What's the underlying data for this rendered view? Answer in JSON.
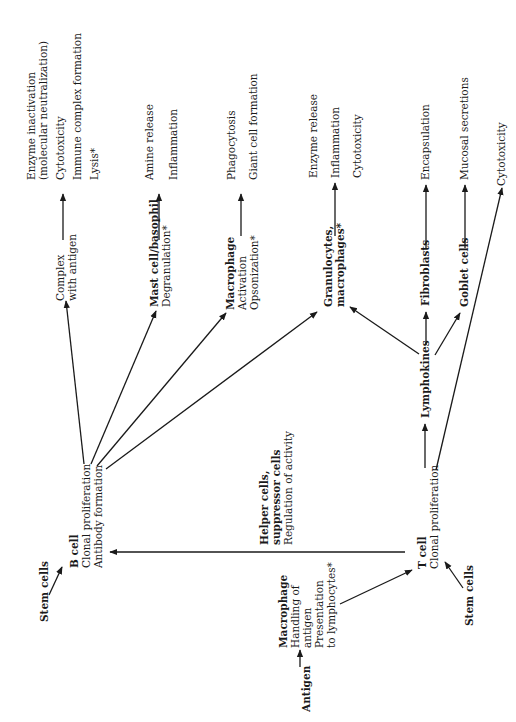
{
  "diagram": {
    "nodes": {
      "stem_cells_b": {
        "lines": [
          "Stem cells"
        ],
        "bold": true
      },
      "b_cell": {
        "lines": [
          "B cell",
          "Clonal proliferation",
          "Antibody formation"
        ],
        "bold_first": true
      },
      "complex": {
        "lines": [
          "Complex",
          "with antigen"
        ]
      },
      "mast_cell": {
        "lines": [
          "Mast cell/basophil",
          "Degranulation*"
        ],
        "bold_first": true
      },
      "macrophage_b": {
        "lines": [
          "Macrophage",
          "Activation",
          "Opsonization*"
        ],
        "bold_first": true
      },
      "granulocytes": {
        "lines": [
          "Granulocytes,",
          "macrophages*"
        ],
        "bold": true
      },
      "outcomes_complex": {
        "lines": [
          "Enzyme inactivation",
          "(molecular neutralization)",
          "Cytotoxicity",
          "Immune complex formation",
          "Lysis*"
        ]
      },
      "outcomes_mast": {
        "lines": [
          "Amine release",
          "Inflammation"
        ]
      },
      "outcomes_macrophage": {
        "lines": [
          "Phagocytosis",
          "Giant cell formation"
        ]
      },
      "outcomes_granulocytes": {
        "lines": [
          "Enzyme release",
          "Inflammation",
          "Cytotoxicity"
        ]
      },
      "lymphokines": {
        "lines": [
          "Lymphokines"
        ],
        "bold": true
      },
      "fibroblasts": {
        "lines": [
          "Fibroblasts"
        ],
        "bold": true
      },
      "goblet_cells": {
        "lines": [
          "Goblet cells"
        ],
        "bold": true
      },
      "encapsulation": {
        "lines": [
          "Encapsulation"
        ]
      },
      "mucosal_secretions": {
        "lines": [
          "Mucosal secretions"
        ]
      },
      "cytotoxicity_t": {
        "lines": [
          "Cytotoxicity"
        ]
      },
      "helper_cells": {
        "lines": [
          "Helper cells,",
          "suppressor cells",
          "Regulation of activity"
        ],
        "bold_first_two": true
      },
      "t_cell": {
        "lines": [
          "T cell",
          "Clonal proliferation"
        ],
        "bold_first": true
      },
      "stem_cells_t": {
        "lines": [
          "Stem cells"
        ],
        "bold": true
      },
      "macrophage_t": {
        "lines": [
          "Macrophage",
          "Handling of",
          "antigen",
          "Presentation",
          "to lymphocytes*"
        ],
        "bold_first": true
      },
      "antigen": {
        "lines": [
          "Antigen"
        ],
        "bold": true
      }
    },
    "edges": [
      {
        "from": "stem_cells_b",
        "to": "b_cell"
      },
      {
        "from": "b_cell",
        "to": "complex"
      },
      {
        "from": "b_cell",
        "to": "mast_cell"
      },
      {
        "from": "b_cell",
        "to": "macrophage_b"
      },
      {
        "from": "b_cell",
        "to": "granulocytes"
      },
      {
        "from": "complex",
        "to": "outcomes_complex"
      },
      {
        "from": "mast_cell",
        "to": "outcomes_mast"
      },
      {
        "from": "macrophage_b",
        "to": "outcomes_macrophage"
      },
      {
        "from": "granulocytes",
        "to": "outcomes_granulocytes"
      },
      {
        "from": "t_cell",
        "to": "b_cell",
        "label": "helper_cells"
      },
      {
        "from": "t_cell",
        "to": "lymphokines"
      },
      {
        "from": "t_cell",
        "to": "cytotoxicity_t"
      },
      {
        "from": "lymphokines",
        "to": "granulocytes"
      },
      {
        "from": "lymphokines",
        "to": "fibroblasts"
      },
      {
        "from": "lymphokines",
        "to": "goblet_cells"
      },
      {
        "from": "fibroblasts",
        "to": "encapsulation"
      },
      {
        "from": "goblet_cells",
        "to": "mucosal_secretions"
      },
      {
        "from": "stem_cells_t",
        "to": "t_cell"
      },
      {
        "from": "antigen",
        "to": "macrophage_t"
      },
      {
        "from": "macrophage_t",
        "to": "t_cell"
      }
    ],
    "line_color": "#1a1a1a"
  }
}
